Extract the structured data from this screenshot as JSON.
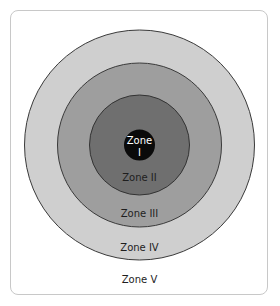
{
  "diagram": {
    "type": "concentric-zones",
    "zones": [
      {
        "id": "zone-1",
        "label_line1": "Zone",
        "label_line2": "I",
        "fill": "#0a0a0a",
        "text_color": "#ffffff"
      },
      {
        "id": "zone-2",
        "label": "Zone II",
        "fill": "#6f6f6f",
        "text_color": "#1e1e1e"
      },
      {
        "id": "zone-3",
        "label": "Zone III",
        "fill": "#9e9e9e",
        "text_color": "#1e1e1e"
      },
      {
        "id": "zone-4",
        "label": "Zone IV",
        "fill": "#cfcfcf",
        "text_color": "#1e1e1e"
      },
      {
        "id": "zone-5",
        "label": "Zone V",
        "fill": "#ffffff",
        "text_color": "#1e1e1e"
      }
    ],
    "stroke": "#3a3a3a",
    "frame_border": "#c8c8c8"
  }
}
